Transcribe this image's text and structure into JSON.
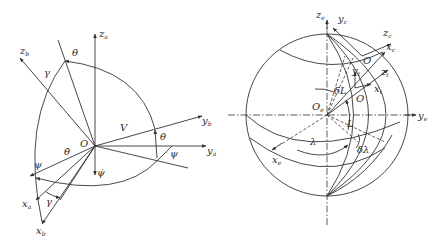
{
  "figures": [
    {
      "id": "left",
      "title": "",
      "labels": {
        "za": "z",
        "za_sub": "a",
        "zb": "z",
        "zb_sub": "b",
        "yb": "y",
        "yb_sub": "b",
        "ya": "y",
        "ya_sub": "a",
        "xa": "x",
        "xa_sub": "a",
        "xb": "x",
        "xb_sub": "b",
        "origin": "O",
        "theta_top": "θ",
        "theta_right": "θ",
        "gamma_top": "γ",
        "gamma_bottom": "γ",
        "psi_left": "ψ",
        "psi_right": "ψ",
        "V": "V",
        "theta_dot": "θ̇",
        "psi_dot": "ψ̇"
      }
    },
    {
      "id": "right",
      "title": "",
      "labels": {
        "ze": "z",
        "ze_sub": "e",
        "yc": "y",
        "yc_sub": "c",
        "zc": "z",
        "zc_sub": "c",
        "xc": "x",
        "xc_sub": "c",
        "O_top": "O",
        "yt": "y",
        "yt_sub": "t",
        "zt": "z",
        "zt_sub": "t",
        "xt": "x",
        "xt_sub": "t",
        "O_mid": "O",
        "Oe": "O",
        "Oe_sub": "e",
        "deltaL": "δL",
        "L": "L",
        "lambda": "λ",
        "deltaLambda": "δλ",
        "ye": "y",
        "ye_sub": "e",
        "xe": "x",
        "xe_sub": "e"
      }
    }
  ]
}
